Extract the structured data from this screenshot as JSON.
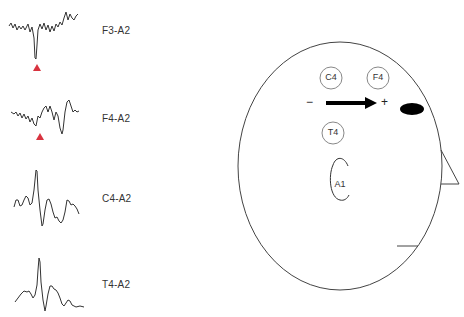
{
  "traces": [
    {
      "label": "F3-A2",
      "marker": true
    },
    {
      "label": "F4-A2",
      "marker": true
    },
    {
      "label": "C4-A2",
      "marker": false
    },
    {
      "label": "T4-A2",
      "marker": false
    }
  ],
  "head": {
    "electrodes": [
      {
        "label": "C4"
      },
      {
        "label": "F4"
      },
      {
        "label": "T4"
      }
    ],
    "ear_label": "A1",
    "dipole": {
      "negative": "−",
      "positive": "+"
    }
  },
  "colors": {
    "marker": "#d8333f",
    "line": "#333333"
  }
}
